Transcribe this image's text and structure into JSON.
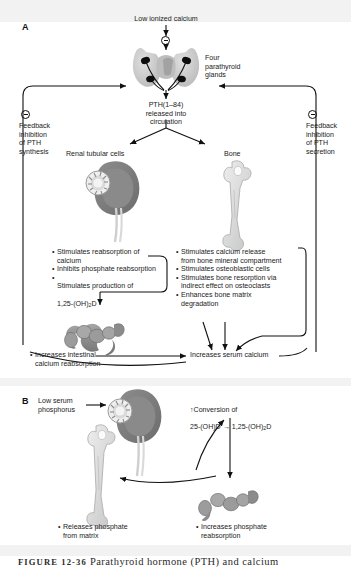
{
  "figure": {
    "caption_label": "FIGURE 12-36",
    "caption_text": "Parathyroid hormone (PTH) and calcium"
  },
  "panelA": {
    "letter": "A",
    "low_ionized_calcium": "Low ionized calcium",
    "four_glands": "Four\nparathyroid\nglands",
    "pth_released": "PTH(1–84)\nreleased into\ncirculation",
    "feedback_left": "Feedback\ninhibition\nof PTH\nsynthesis",
    "feedback_right": "Feedback\ninhibition\nof PTH\nsecretion",
    "renal_label": "Renal tubular cells",
    "bone_label": "Bone",
    "kidney_effects": [
      "Stimulates reabsorption of\ncalcium",
      "Inhibits phosphate reabsorption",
      "Stimulates production of\n1,25-(OH)2D"
    ],
    "kidney_effect_3_main": "Stimulates production of",
    "kidney_effect_3_sub_pre": "1,25-(OH)",
    "kidney_effect_3_sub_num": "2",
    "kidney_effect_3_sub_post": "D",
    "bone_effects": [
      "Stimulates calcium release\nfrom bone mineral compartment",
      "Stimulates osteoblastic cells",
      "Stimulates bone resorption via\nindirect effect on osteoclasts",
      "Enhances bone matrix\ndegradation"
    ],
    "intestinal": "Increases intestinal\ncalcium reabsorption",
    "serum_calcium": "Increases serum calcium",
    "sign_icon": "minus-circle-icon"
  },
  "panelB": {
    "letter": "B",
    "low_serum_phosphorus": "Low serum\nphosphorus",
    "conversion_line1": "↑Conversion of",
    "conversion_pre": "25-(OH)D → 1,25-(OH)",
    "conversion_sub": "2",
    "conversion_post": "D",
    "releases_phosphate": "Releases phosphate\nfrom matrix",
    "increases_phosphate": "Increases phosphate\nreabsorption"
  },
  "colors": {
    "ink": "#1b1b1b",
    "band": "#f2f2f2",
    "gland_light": "#c9c9c9",
    "gland_dark": "#0d0d0d",
    "kidney_dark": "#7b7b7b",
    "kidney_mid": "#9a9a9a",
    "bone": "#d8d8d8",
    "intestine": "#8e8e8e"
  }
}
